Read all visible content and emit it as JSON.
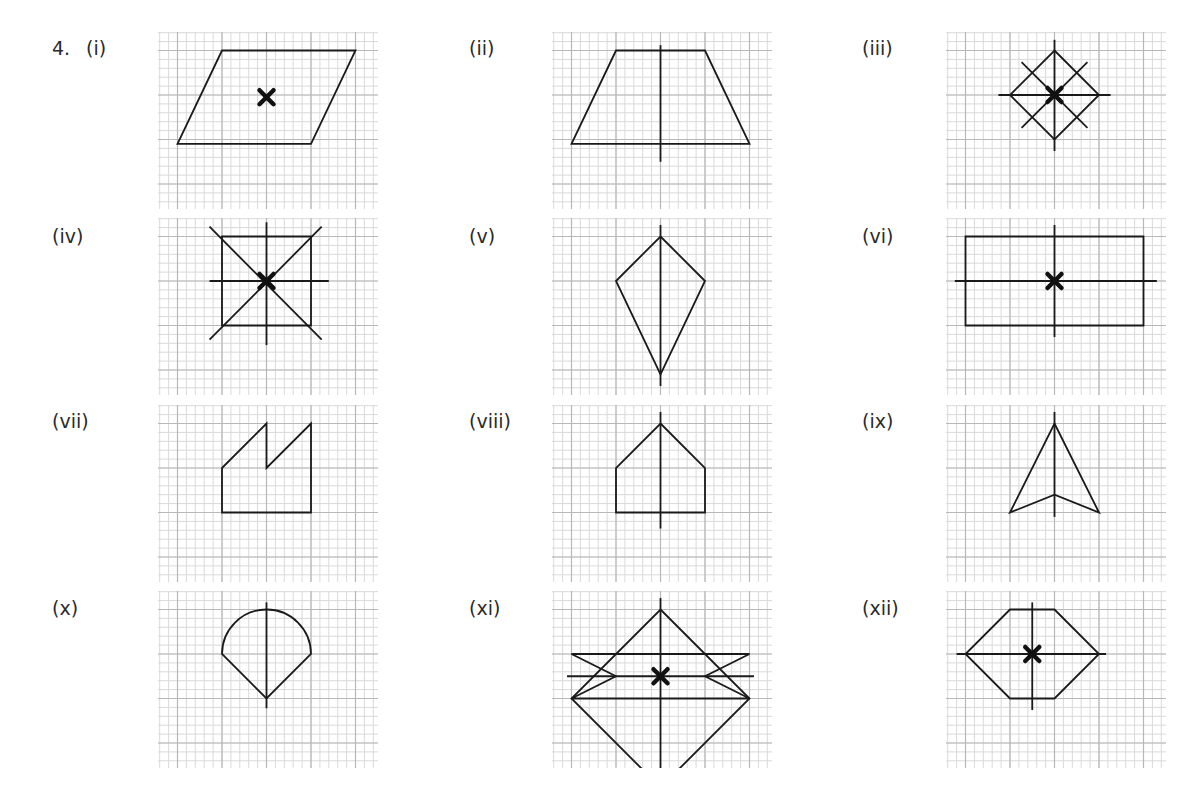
{
  "question_number": "4.",
  "panels": [
    {
      "label": "(i)",
      "shape": "parallelogram",
      "center_mark": true,
      "symmetry_lines": 0
    },
    {
      "label": "(ii)",
      "shape": "isosceles-trapezium",
      "center_mark": false,
      "symmetry_lines": 1
    },
    {
      "label": "(iii)",
      "shape": "square-rotated",
      "center_mark": true,
      "symmetry_lines": 4
    },
    {
      "label": "(iv)",
      "shape": "square",
      "center_mark": true,
      "symmetry_lines": 4
    },
    {
      "label": "(v)",
      "shape": "kite",
      "center_mark": false,
      "symmetry_lines": 1
    },
    {
      "label": "(vi)",
      "shape": "rectangle",
      "center_mark": true,
      "symmetry_lines": 2
    },
    {
      "label": "(vii)",
      "shape": "saw-tooth-pentagon",
      "center_mark": false,
      "symmetry_lines": 0
    },
    {
      "label": "(viii)",
      "shape": "house-pentagon",
      "center_mark": false,
      "symmetry_lines": 1
    },
    {
      "label": "(ix)",
      "shape": "arrowhead",
      "center_mark": false,
      "symmetry_lines": 1
    },
    {
      "label": "(x)",
      "shape": "semicircle-on-triangle",
      "center_mark": false,
      "symmetry_lines": 1
    },
    {
      "label": "(xi)",
      "shape": "star-of-rhombus-and-bars",
      "center_mark": true,
      "symmetry_lines": 2
    },
    {
      "label": "(xii)",
      "shape": "hexagon",
      "center_mark": true,
      "symmetry_lines": 2
    }
  ]
}
